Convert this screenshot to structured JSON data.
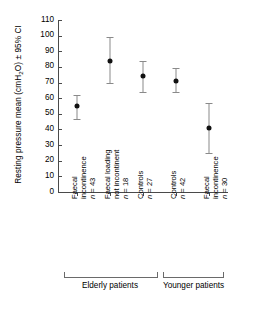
{
  "chart_data": {
    "type": "scatter",
    "title": "",
    "xlabel": "",
    "ylabel": "Resting pressure mean (cmH2O) ± 95% CI",
    "ylabel_parts": {
      "pre": "Resting pressure mean (cmH",
      "sub": "2",
      "post": "O) ± 95% CI"
    },
    "ylim": [
      0,
      110
    ],
    "ytick_values": [
      0,
      10,
      20,
      30,
      40,
      50,
      60,
      70,
      80,
      90,
      100,
      110
    ],
    "ytick_labels": [
      "0",
      "10",
      "20",
      "30",
      "40",
      "50",
      "60",
      "70",
      "80",
      "90",
      "100",
      "110"
    ],
    "grid": false,
    "legend": "none",
    "error_bar_type": "95% CI",
    "categories": [
      "Faecal incontinence n = 43",
      "Faecal loading not incontinent n = 18",
      "Controls n = 27",
      "Controls n = 42",
      "Faecal incontinence n = 30"
    ],
    "values": [
      55,
      84,
      74,
      71,
      41
    ],
    "ci_low": [
      47,
      70,
      64,
      64,
      25
    ],
    "ci_high": [
      62,
      99,
      84,
      79,
      57
    ],
    "points": [
      {
        "index": 0,
        "label_line1": "Faecal",
        "label_line2": "incontinence",
        "label_line3_n": "n",
        "label_line3_val": " = 43",
        "n": 43,
        "mean": 55,
        "ci_low": 47,
        "ci_high": 62,
        "group": "Elderly patients"
      },
      {
        "index": 1,
        "label_line1": "Faecal loading",
        "label_line2": "not incontinent",
        "label_line3_n": "n",
        "label_line3_val": " = 18",
        "n": 18,
        "mean": 84,
        "ci_low": 70,
        "ci_high": 99,
        "group": "Elderly patients"
      },
      {
        "index": 2,
        "label_line1": "Controls",
        "label_line2": "",
        "label_line3_n": "n",
        "label_line3_val": " = 27",
        "n": 27,
        "mean": 74,
        "ci_low": 64,
        "ci_high": 84,
        "group": "Elderly patients"
      },
      {
        "index": 3,
        "label_line1": "Controls",
        "label_line2": "",
        "label_line3_n": "n",
        "label_line3_val": " = 42",
        "n": 42,
        "mean": 71,
        "ci_low": 64,
        "ci_high": 79,
        "group": "Younger patients"
      },
      {
        "index": 4,
        "label_line1": "Faecal",
        "label_line2": "incontinence",
        "label_line3_n": "n",
        "label_line3_val": " = 30",
        "n": 30,
        "mean": 41,
        "ci_low": 25,
        "ci_high": 57,
        "group": "Younger patients"
      }
    ],
    "groups": [
      {
        "label": "Elderly patients",
        "members": [
          0,
          1,
          2
        ]
      },
      {
        "label": "Younger patients",
        "members": [
          3,
          4
        ]
      }
    ],
    "colors": {
      "marker": "#111111",
      "error_bar": "#8a8a8a",
      "axis": "#4a4a4a",
      "text": "#000000",
      "background": "#ffffff"
    }
  }
}
